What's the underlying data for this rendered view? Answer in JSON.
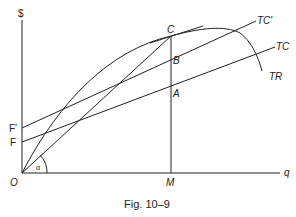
{
  "figure": {
    "caption": "Fig. 10–9",
    "axes": {
      "y_label": "$",
      "x_label": "q",
      "origin_label": "O"
    },
    "intercepts": {
      "f_prime": "F′",
      "f": "F"
    },
    "points": {
      "c": "C",
      "b": "B",
      "a": "A",
      "m": "M"
    },
    "curves": {
      "tc_prime": "TC′",
      "tc": "TC",
      "tr": "TR"
    },
    "angle_label": "α"
  }
}
